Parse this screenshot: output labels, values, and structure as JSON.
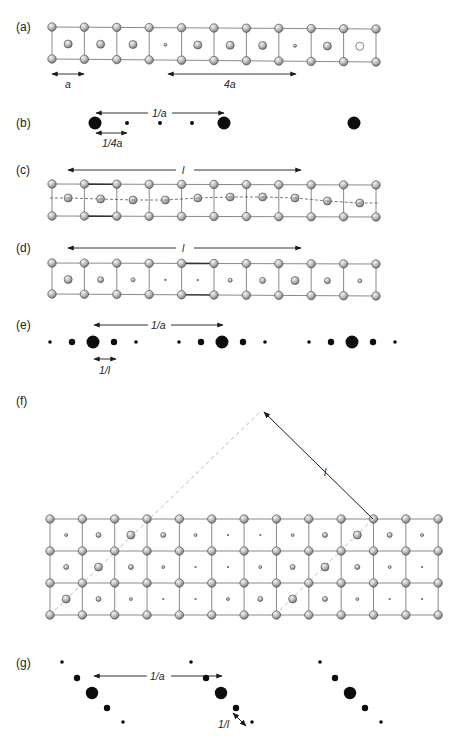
{
  "figure": {
    "width": 463,
    "height": 738,
    "colors": {
      "bond": "#8a8a8a",
      "bond_thick": "#333333",
      "atom_fill_light": "#e6e6e6",
      "atom_fill_dark": "#8e8e8e",
      "atom_stroke": "#555555",
      "spot": "#0d0d0d",
      "arrow": "#1a1a1a",
      "dashed_guide": "#bdbdbd"
    }
  },
  "panels": {
    "a": {
      "label": "(a)",
      "dims": [
        {
          "text": "a",
          "x1": 52,
          "x2": 84,
          "y": 74,
          "label_x": 68,
          "label_y": 88
        },
        {
          "text": "4a",
          "x1": 168,
          "x2": 296,
          "y": 74,
          "label_x": 230,
          "label_y": 88
        }
      ],
      "center_atom_radii": [
        4,
        4,
        4,
        1.5,
        4,
        4,
        4,
        1.5,
        4,
        4
      ],
      "hollow_center_index": 9
    },
    "b": {
      "label": "(b)",
      "top_dim": {
        "text": "1/a",
        "x1": 96,
        "x2": 225,
        "y": 113
      },
      "bottom_dim": {
        "text": "1/4a",
        "x1": 96,
        "x2": 127,
        "y": 133,
        "label_x": 110,
        "label_y": 146
      },
      "spots": [
        {
          "x": 95,
          "r": 6.5
        },
        {
          "x": 127,
          "r": 2
        },
        {
          "x": 160,
          "r": 2
        },
        {
          "x": 192,
          "r": 2
        },
        {
          "x": 224,
          "r": 6.5
        },
        {
          "x": 354,
          "r": 6.5
        }
      ],
      "y": 123
    },
    "c": {
      "label": "(c)",
      "dim": {
        "text": "l",
        "x1": 68,
        "x2": 301,
        "y": 170
      }
    },
    "d": {
      "label": "(d)",
      "dim": {
        "text": "l",
        "x1": 68,
        "x2": 301,
        "y": 248
      },
      "center_atom_radii": [
        4,
        3,
        2,
        1,
        1,
        2,
        3,
        4,
        3,
        2
      ]
    },
    "e": {
      "label": "(e)",
      "top_dim": {
        "text": "1/a",
        "x1": 94,
        "x2": 223,
        "y": 325
      },
      "bottom_dim": {
        "text": "1/l",
        "x1": 94,
        "x2": 116,
        "y": 359,
        "label_x": 105,
        "label_y": 373
      },
      "y": 342,
      "groups": [
        93,
        222,
        352
      ],
      "group_offsets": [
        -43,
        -21,
        0,
        21,
        43
      ],
      "group_radii": [
        1.8,
        3.2,
        6.5,
        3.2,
        1.8
      ]
    },
    "f": {
      "label": "(f)",
      "dim": {
        "text": "l"
      },
      "apex": {
        "x": 262,
        "y": 410
      },
      "arrow_origin": {
        "x": 373,
        "y": 519
      },
      "center_atom_rows": [
        [
          1.5,
          2.5,
          4,
          2.5,
          1.5,
          0.8,
          0.8,
          1.5,
          2.5,
          4,
          2.5,
          1.5
        ],
        [
          2.5,
          4,
          2.5,
          1.5,
          0.8,
          0.8,
          1.5,
          2.5,
          4,
          2.5,
          1.5,
          0.8
        ],
        [
          4,
          2.5,
          1.5,
          0.8,
          0.8,
          1.5,
          2.5,
          4,
          2.5,
          1.5,
          0.8,
          0.8
        ]
      ]
    },
    "g": {
      "label": "(g)",
      "top_dim": {
        "text": "1/a",
        "x1": 94,
        "x2": 222,
        "y": 676
      },
      "diag_dim": {
        "text": "1/l",
        "label_x": 223,
        "label_y": 726
      },
      "groups": [
        92,
        221,
        350
      ],
      "group_dx": [
        -30,
        -15,
        0,
        15,
        31
      ],
      "group_dy": [
        -31,
        -15,
        0,
        15,
        29
      ],
      "center_y": 693,
      "group_radii": [
        1.8,
        3.2,
        6.2,
        3.2,
        1.8
      ]
    }
  }
}
